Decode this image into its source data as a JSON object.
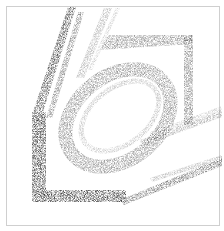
{
  "figure": {
    "type": "topology-optimization-density-plot",
    "frame_color": "#cfcfcf",
    "material_color": "#3a3a3a",
    "background_color": "#ffffff",
    "members": [
      {
        "name": "left-outer-strut",
        "points": "68,7 76,7 42,115 32,115",
        "density": 0.9
      },
      {
        "name": "left-inner-strut",
        "points": "78,12 84,12 52,118 46,118",
        "density": 0.6
      },
      {
        "name": "upper-light-strut-a",
        "points": "104,8 112,8 84,78 76,78",
        "density": 0.35
      },
      {
        "name": "upper-light-strut-b",
        "points": "116,8 120,8 92,70 88,70",
        "density": 0.25
      },
      {
        "name": "top-frame-bar",
        "points": "108,35 192,35 192,44 100,50",
        "density": 0.55
      },
      {
        "name": "right-frame-bar",
        "points": "184,35 193,35 193,125 184,125",
        "density": 0.6
      },
      {
        "name": "left-column",
        "points": "32,112 46,112 46,202 32,202",
        "density": 1.0
      },
      {
        "name": "bottom-bar",
        "points": "32,190 126,190 126,202 32,202",
        "density": 1.0
      },
      {
        "name": "lower-right-strut-a",
        "points": "120,200 222,158 222,166 124,205",
        "density": 0.7
      },
      {
        "name": "lower-right-strut-b",
        "points": "150,178 222,155 222,160 152,182",
        "density": 0.35
      },
      {
        "name": "mid-right-strut-a",
        "points": "140,140 222,110 222,117 142,146",
        "density": 0.4
      },
      {
        "name": "mid-right-strut-b",
        "points": "150,132 222,106 222,110 150,136",
        "density": 0.25
      }
    ],
    "ring": {
      "cx": 118,
      "cy": 118,
      "rx": 58,
      "ry": 42,
      "rotate": -38,
      "stroke_width": 14,
      "density": 0.55
    },
    "inner_ring": {
      "cx": 120,
      "cy": 116,
      "rx": 44,
      "ry": 28,
      "rotate": -38,
      "stroke_width": 5,
      "density": 0.3
    }
  }
}
